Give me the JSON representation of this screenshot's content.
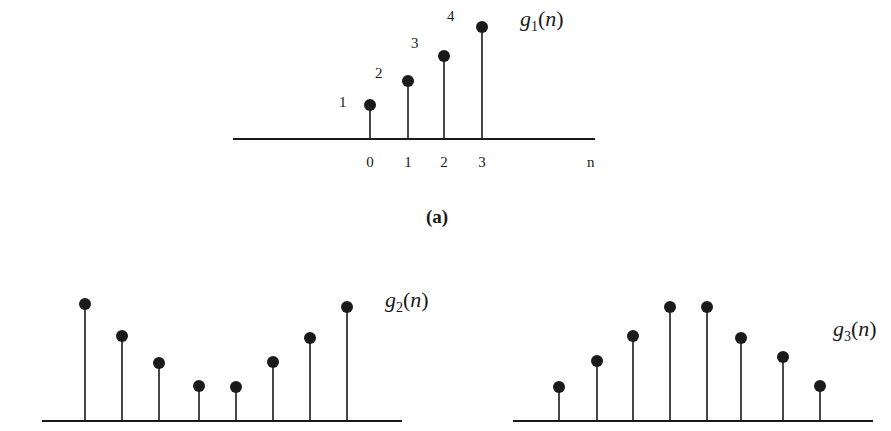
{
  "colors": {
    "ink": "#1a1a1a",
    "background": "#ffffff"
  },
  "chart_data": [
    {
      "type": "stem",
      "title": "g_1(n)",
      "name": "g1",
      "label_main": "g",
      "label_sub": "1",
      "label_arg": "n",
      "caption": "(a)",
      "xlabel": "n",
      "x": [
        0,
        1,
        2,
        3
      ],
      "values": [
        1,
        2,
        3,
        4
      ],
      "tick_labels": [
        "0",
        "1",
        "2",
        "3"
      ],
      "value_labels": [
        "1",
        "2",
        "3",
        "4"
      ],
      "grid": false
    },
    {
      "type": "stem",
      "title": "g_2(n)",
      "name": "g2",
      "label_main": "g",
      "label_sub": "2",
      "label_arg": "n",
      "x": [
        0,
        1,
        2,
        3,
        4,
        5,
        6,
        7
      ],
      "values": [
        4,
        3,
        2.2,
        1.4,
        1.4,
        2.2,
        3,
        3.9
      ],
      "grid": false
    },
    {
      "type": "stem",
      "title": "g_3(n)",
      "name": "g3",
      "label_main": "g",
      "label_sub": "3",
      "label_arg": "n",
      "x": [
        0,
        1,
        2,
        3,
        4,
        5,
        6,
        7
      ],
      "values": [
        1.4,
        2.2,
        3,
        3.9,
        3.9,
        3,
        2.4,
        1.4
      ],
      "grid": false
    }
  ],
  "layout": {
    "g1": {
      "axis": {
        "x1": 233,
        "x2": 595,
        "y": 139
      },
      "stems_x": [
        370,
        408,
        444,
        482
      ],
      "dots_y": [
        105,
        81,
        56,
        27
      ],
      "value_label_pos": [
        [
          339,
          107
        ],
        [
          375,
          78
        ],
        [
          411,
          48
        ],
        [
          447,
          21
        ]
      ],
      "tick_y": 167,
      "xlabel_pos": [
        587,
        167
      ],
      "title_pos": [
        520,
        26
      ],
      "caption_pos": [
        437,
        223
      ]
    },
    "g2": {
      "axis": {
        "x1": 42,
        "x2": 402,
        "y": 421
      },
      "stems_x": [
        85,
        122,
        159,
        199,
        236,
        273,
        310,
        347
      ],
      "dots_y": [
        304,
        336,
        363,
        386,
        387,
        362,
        338,
        307
      ],
      "title_pos": [
        385,
        307
      ]
    },
    "g3": {
      "axis": {
        "x1": 513,
        "x2": 873,
        "y": 421
      },
      "stems_x": [
        559,
        597,
        633,
        670,
        707,
        741,
        783,
        820
      ],
      "dots_y": [
        387,
        361,
        336,
        307,
        307,
        338,
        357,
        386
      ],
      "title_pos": [
        833,
        336
      ]
    }
  }
}
